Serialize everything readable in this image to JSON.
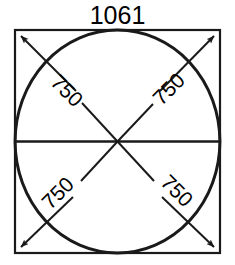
{
  "drawing": {
    "type": "technical-dimension-drawing",
    "description": "Square outline with inscribed circle, horizontal centerline, and four radial dimension arrows to the corners",
    "top_dimension": {
      "label": "1061",
      "units": "",
      "position": "top-center",
      "refers_to": "square-width"
    },
    "radial_dimensions": [
      {
        "id": "top-left",
        "label": "750",
        "rotation_deg": 45,
        "text_x": 62,
        "text_y": 96
      },
      {
        "id": "top-right",
        "label": "750",
        "rotation_deg": -45,
        "text_x": 154,
        "text_y": 72
      },
      {
        "id": "bottom-left",
        "label": "750",
        "rotation_deg": -45,
        "text_x": 46,
        "text_y": 212
      },
      {
        "id": "bottom-right",
        "label": "750",
        "rotation_deg": 45,
        "text_x": 148,
        "text_y": 186
      }
    ],
    "geometry": {
      "square": {
        "x": 15,
        "y": 30,
        "width": 205,
        "height": 223
      },
      "circle": {
        "cx": 117.5,
        "cy": 141.5,
        "rx": 102.5,
        "ry": 111.5
      },
      "centerline": {
        "x1": 15,
        "y1": 141.5,
        "x2": 220,
        "y2": 141.5
      },
      "center": {
        "x": 117.5,
        "y": 141.5
      }
    },
    "colors": {
      "stroke": "#1a1a1a",
      "background": "#ffffff",
      "text": "#000000"
    }
  }
}
